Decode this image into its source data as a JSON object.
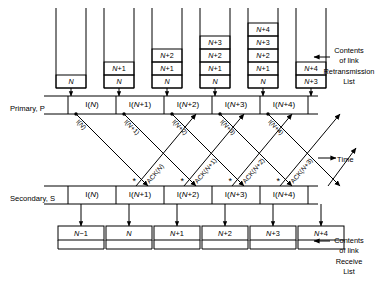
{
  "diagram": {
    "axis_note": "Time",
    "primary_label": "Primary, P",
    "secondary_label": "Secondary, S",
    "retransmission_caption": [
      "Contents",
      "of  link",
      "Retransmission",
      "List"
    ],
    "receive_caption": [
      "Contents",
      "of  link",
      "Receive",
      "List"
    ]
  },
  "retransmission_stacks": [
    {
      "x": 56,
      "contents": [
        "N"
      ]
    },
    {
      "x": 104,
      "contents": [
        "N",
        "N+1"
      ]
    },
    {
      "x": 152,
      "contents": [
        "N",
        "N+1",
        "N+2"
      ]
    },
    {
      "x": 200,
      "contents": [
        "N",
        "N+1",
        "N+2",
        "N+3"
      ]
    },
    {
      "x": 248,
      "contents": [
        "N",
        "N+1",
        "N+2",
        "N+3",
        "N+4"
      ]
    },
    {
      "x": 296,
      "contents": [
        "N+3",
        "N+4"
      ]
    }
  ],
  "primary_frames": [
    {
      "label": "I(N)"
    },
    {
      "label": "I(N+1)"
    },
    {
      "label": "I(N+2)"
    },
    {
      "label": "I(N+3)"
    },
    {
      "label": "I(N+4)"
    }
  ],
  "secondary_frames": [
    {
      "label": "I(N)"
    },
    {
      "label": "I(N+1)"
    },
    {
      "label": "I(N+2)"
    },
    {
      "label": "I(N+3)"
    },
    {
      "label": "I(N+4)"
    }
  ],
  "receive_boxes": [
    {
      "label": "N−1"
    },
    {
      "label": "N"
    },
    {
      "label": "N+1"
    },
    {
      "label": "N+2"
    },
    {
      "label": "N+3"
    },
    {
      "label": "N+4"
    }
  ],
  "transfer_arrows": [
    {
      "kind": "info",
      "label": "I(N)"
    },
    {
      "kind": "info",
      "label": "I(N+1)"
    },
    {
      "kind": "ack",
      "label": "ACK(N)"
    },
    {
      "kind": "info",
      "label": "I(N+2)"
    },
    {
      "kind": "ack",
      "label": "ACK(N+1)"
    },
    {
      "kind": "info",
      "label": "I(N+3)"
    },
    {
      "kind": "ack",
      "label": "ACK(N+2)"
    },
    {
      "kind": "info",
      "label": "I(N+4)"
    },
    {
      "kind": "ack",
      "label": "ACK(N+3)"
    }
  ],
  "colors": {
    "ink": "#000000",
    "paper": "#ffffff"
  }
}
